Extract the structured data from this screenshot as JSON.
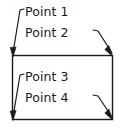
{
  "diagram": {
    "type": "cad-annotation",
    "stroke_color": "#1a1a1a",
    "fill_color": "#ffffff",
    "background_color": "#ffffff",
    "shape": {
      "name": "rectangle",
      "x": 12,
      "y": 55,
      "width": 101,
      "height": 65
    },
    "labels": [
      {
        "id": "point-1",
        "text": "Point 1",
        "target_corner": "top-left",
        "target_x": 13,
        "target_y": 56
      },
      {
        "id": "point-2",
        "text": "Point 2",
        "target_corner": "top-right",
        "target_x": 112,
        "target_y": 56
      },
      {
        "id": "point-3",
        "text": "Point 3",
        "target_corner": "bottom-left",
        "target_x": 13,
        "target_y": 119
      },
      {
        "id": "point-4",
        "text": "Point 4",
        "target_corner": "bottom-right",
        "target_x": 112,
        "target_y": 119
      }
    ]
  }
}
